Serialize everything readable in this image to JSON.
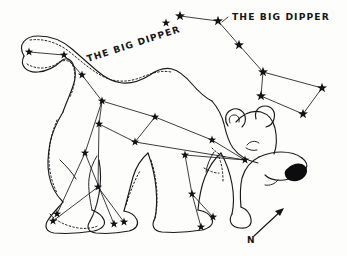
{
  "figure": {
    "kind": "hand-drawn astronomy illustration",
    "background_color": "#fdfdfb",
    "ink_color": "#1a1a1d"
  },
  "labels": {
    "dipper_in_bear": "THE BIG DIPPER",
    "dipper_standalone": "THE BIG DIPPER",
    "compass_north": "N"
  },
  "chart_data": {
    "type": "scatter",
    "title": "THE BIG DIPPER",
    "xlabel": "",
    "ylabel": "",
    "xlim": [
      0,
      347
    ],
    "ylim": [
      256,
      0
    ],
    "grid": false,
    "legend": "none",
    "annotations": [
      {
        "text": "THE BIG DIPPER",
        "x": 88,
        "y": 62,
        "rotation": -18
      },
      {
        "text": "THE BIG DIPPER",
        "x": 232,
        "y": 20,
        "rotation": 0
      },
      {
        "text": "N",
        "x": 251,
        "y": 240,
        "rotation": 0
      }
    ],
    "series": [
      {
        "name": "Big Dipper (standalone, upper right)",
        "star_count": 7,
        "stars": [
          {
            "name": "Alkaid",
            "x": 180,
            "y": 16
          },
          {
            "name": "Mizar",
            "x": 218,
            "y": 21
          },
          {
            "name": "Alioth",
            "x": 239,
            "y": 45
          },
          {
            "name": "Megrez",
            "x": 263,
            "y": 72
          },
          {
            "name": "Phecda",
            "x": 261,
            "y": 96
          },
          {
            "name": "Merak",
            "x": 303,
            "y": 114
          },
          {
            "name": "Dubhe",
            "x": 322,
            "y": 88
          }
        ],
        "links": [
          [
            0,
            1
          ],
          [
            1,
            2
          ],
          [
            2,
            3
          ],
          [
            3,
            4
          ],
          [
            4,
            5
          ],
          [
            5,
            6
          ],
          [
            6,
            3
          ]
        ]
      },
      {
        "name": "Ursa Major stars traced on the bear",
        "star_count": 20,
        "stars": [
          {
            "x": 29,
            "y": 52
          },
          {
            "x": 64,
            "y": 55
          },
          {
            "x": 82,
            "y": 75
          },
          {
            "x": 102,
            "y": 101
          },
          {
            "x": 99,
            "y": 124
          },
          {
            "x": 155,
            "y": 117
          },
          {
            "x": 135,
            "y": 142
          },
          {
            "x": 185,
            "y": 155
          },
          {
            "x": 212,
            "y": 140
          },
          {
            "x": 245,
            "y": 160
          },
          {
            "x": 85,
            "y": 153
          },
          {
            "x": 98,
            "y": 187
          },
          {
            "x": 57,
            "y": 214
          },
          {
            "x": 53,
            "y": 221
          },
          {
            "x": 114,
            "y": 224
          },
          {
            "x": 124,
            "y": 222
          },
          {
            "x": 192,
            "y": 194
          },
          {
            "x": 213,
            "y": 217
          },
          {
            "x": 201,
            "y": 227
          },
          {
            "x": 166,
            "y": 23
          }
        ],
        "links": [
          [
            0,
            1
          ],
          [
            1,
            2
          ],
          [
            2,
            3
          ],
          [
            3,
            4
          ],
          [
            3,
            5
          ],
          [
            5,
            6
          ],
          [
            4,
            6
          ],
          [
            6,
            9
          ],
          [
            5,
            8
          ],
          [
            8,
            9
          ],
          [
            3,
            10
          ],
          [
            10,
            12
          ],
          [
            10,
            14
          ],
          [
            4,
            11
          ],
          [
            11,
            13
          ],
          [
            11,
            15
          ],
          [
            7,
            16
          ],
          [
            16,
            17
          ],
          [
            16,
            18
          ],
          [
            7,
            9
          ]
        ]
      }
    ]
  },
  "compass": {
    "label": "N",
    "direction": "northeast",
    "arrow_from": {
      "x": 254,
      "y": 236
    },
    "arrow_to": {
      "x": 282,
      "y": 210
    }
  }
}
